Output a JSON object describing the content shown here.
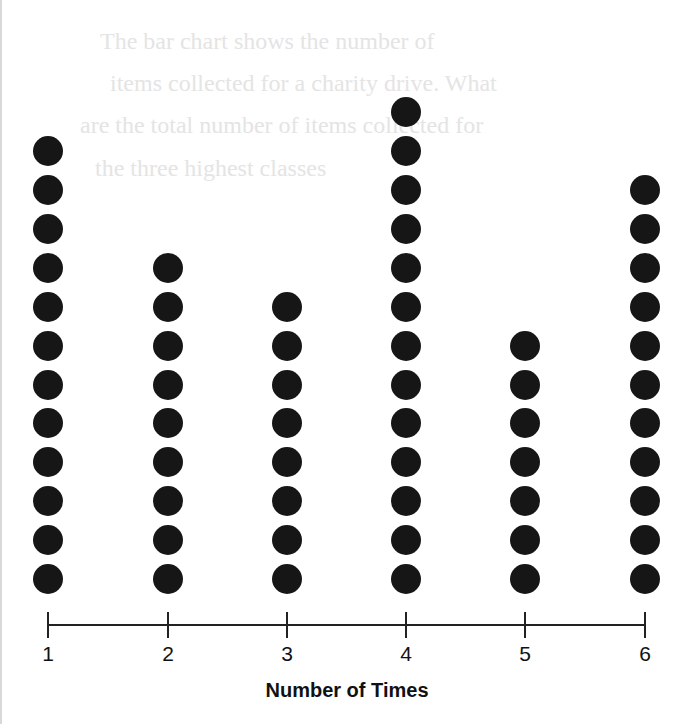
{
  "chart_data": {
    "type": "dot_plot",
    "title": "",
    "xlabel": "Number of Times",
    "ylabel": "",
    "categories": [
      "1",
      "2",
      "3",
      "4",
      "5",
      "6"
    ],
    "values": [
      12,
      9,
      8,
      13,
      7,
      11
    ],
    "grid": false,
    "legend": null
  },
  "axis": {
    "title": "Number of Times",
    "ticks": [
      "1",
      "2",
      "3",
      "4",
      "5",
      "6"
    ]
  },
  "background_ghost_text": [
    "The bar chart shows the number of",
    "items collected for a charity drive. What",
    "are the total number of items collected for",
    "the three highest classes"
  ],
  "colors": {
    "dot": "#161616",
    "axis": "#222222",
    "ghost_text": "#e4e4e4"
  }
}
